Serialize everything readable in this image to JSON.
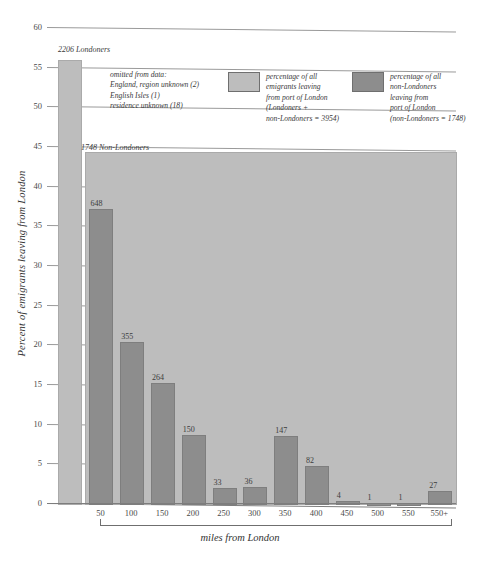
{
  "chart_data": {
    "type": "bar",
    "title": "",
    "xlabel": "miles from London",
    "ylabel": "Percent of emigrants leaving from London",
    "ylim": [
      0,
      60
    ],
    "ytick_step": 5,
    "yticks": [
      "0",
      "5",
      "10",
      "15",
      "20",
      "25",
      "30",
      "35",
      "40",
      "45",
      "50",
      "55",
      "60"
    ],
    "grid": true,
    "legend_position": "top-right",
    "categories": [
      "50",
      "100",
      "150",
      "200",
      "250",
      "300",
      "350",
      "400",
      "450",
      "500",
      "550",
      "550+"
    ],
    "series": [
      {
        "name": "percentage of all non-Londoners leaving from port of London",
        "color": "#8d8d8d",
        "counts": [
          648,
          355,
          264,
          150,
          33,
          36,
          147,
          82,
          4,
          1,
          1,
          27
        ],
        "values": [
          37.07,
          20.31,
          15.1,
          8.58,
          1.89,
          2.06,
          8.41,
          4.69,
          0.23,
          0.06,
          0.06,
          1.54
        ]
      }
    ],
    "overlays": [
      {
        "name": "londoners-total-bar",
        "label": "2206 Londoners",
        "count": 2206,
        "value": 55.79,
        "color": "#bdbdbd"
      },
      {
        "name": "non-londoners-total-band",
        "label": "1748 Non-Londoners",
        "count": 1748,
        "value": 44.21,
        "color": "#bdbdbd"
      }
    ],
    "annotations": {
      "omitted_title": "omitted from data:",
      "omitted_lines": [
        "England, region unknown (2)",
        "English Isles (1)",
        "residence unknown (18)"
      ]
    },
    "legend": [
      {
        "swatch_color": "#bdbdbd",
        "lines": [
          "percentage of all",
          "emigrants leaving",
          "from port of London",
          "(Londoners +",
          "non-Londoners = 3954)"
        ]
      },
      {
        "swatch_color": "#8d8d8d",
        "lines": [
          "percentage of all",
          "non-Londoners",
          "leaving from",
          "port of London",
          "(non-Londoners = 1748)"
        ]
      }
    ],
    "totals": {
      "all_emigrants": 3954,
      "londoners": 2206,
      "non_londoners": 1748
    }
  }
}
